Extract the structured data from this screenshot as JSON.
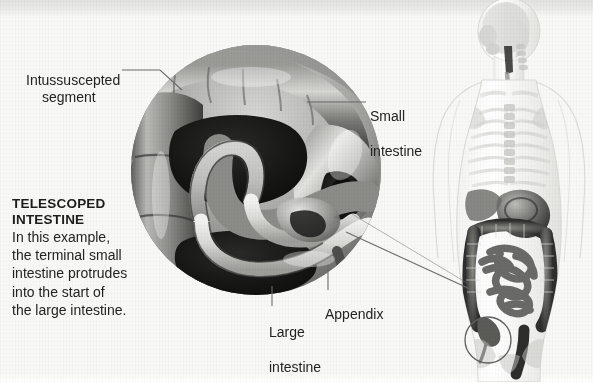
{
  "figure": {
    "kind": "medical-illustration",
    "background_color": "#f8f8f6",
    "ink_color": "#232323"
  },
  "caption": {
    "title_line1": "TELESCOPED",
    "title_line2": "INTESTINE",
    "body_line1": "In this example,",
    "body_line2": "the terminal small",
    "body_line3": "intestine protrudes",
    "body_line4": "into the start of",
    "body_line5": "the large intestine."
  },
  "labels": {
    "intussuscepted_line1": "Intussuscepted",
    "intussuscepted_line2": "segment",
    "small_intestine_line1": "Small",
    "small_intestine_line2": "intestine",
    "large_intestine_line1": "Large",
    "large_intestine_line2": "intestine",
    "appendix": "Appendix"
  },
  "inset": {
    "name": "magnified-cross-section",
    "description": "Circular cut-away view of the ileocecal junction showing the terminal small intestine telescoped into the large intestine",
    "center_x": 256,
    "center_y": 170,
    "diameter": 250
  },
  "body_figure": {
    "name": "transparent-human-torso",
    "description": "Semi-transparent posterior human torso showing skeleton and digestive tract",
    "marker": "ileocecal-region-circle"
  },
  "colors": {
    "paper": "#f8f8f6",
    "tissue_light": "#e9e9e7",
    "tissue_mid": "#9a9a98",
    "tissue_dark": "#3a3a3a",
    "lumen_black": "#141414",
    "leader_line": "#6b6b6b",
    "skeleton": "#cfcfcb",
    "gut_dark": "#4a4a48"
  }
}
